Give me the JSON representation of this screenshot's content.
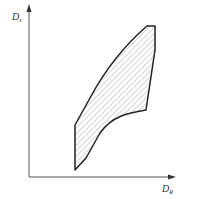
{
  "diagram": {
    "type": "region-plot",
    "y_axis": {
      "label_main": "D",
      "label_sub": "s"
    },
    "x_axis": {
      "label_main": "D",
      "label_sub": "R"
    },
    "region": {
      "fill": "diagonal-hatch",
      "stroke_color": "#222222",
      "hatch_color": "#aaaaaa"
    },
    "colors": {
      "axis": "#555555",
      "background": "#ffffff"
    }
  }
}
